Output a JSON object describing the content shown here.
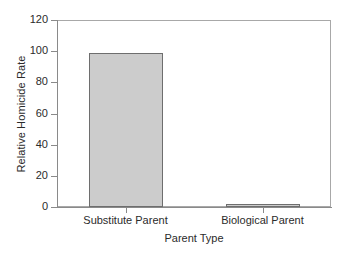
{
  "chart_data": {
    "type": "bar",
    "title": "",
    "xlabel": "Parent Type",
    "ylabel": "Relative Homicide Rate",
    "categories": [
      "Substitute Parent",
      "Biological Parent"
    ],
    "values": [
      99,
      2
    ],
    "ylim": [
      0,
      120
    ],
    "yticks": [
      0,
      20,
      40,
      60,
      80,
      100,
      120
    ],
    "ytick_labels": [
      "0",
      "20",
      "40",
      "60",
      "80",
      "100",
      "120"
    ],
    "grid": false,
    "legend": null,
    "legend_position": "none",
    "bar_fill_color": "#cccccc",
    "bar_edge_color": "#6e6e6e",
    "axis_color": "#8a8a8a",
    "background_color": "#ffffff",
    "text_color": "#2b2b2b"
  }
}
